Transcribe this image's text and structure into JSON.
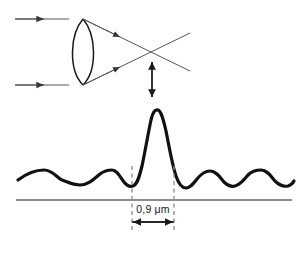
{
  "figure": {
    "background_color": "#ffffff",
    "width": 306,
    "height": 253
  },
  "optics": {
    "lens": {
      "name": "biconvex-lens",
      "color": "#1a1a1a",
      "top_vertex_y": 19,
      "bottom_vertex_y": 85,
      "left_x": 68,
      "right_x": 98
    },
    "incoming_rays": [
      {
        "label": "upper-incoming-ray",
        "y": 19,
        "x_start": 15,
        "x_end": 68,
        "arrow_x": 42
      },
      {
        "label": "lower-incoming-ray",
        "y": 85,
        "x_start": 15,
        "x_end": 68,
        "arrow_x": 42
      }
    ],
    "converging_rays": [
      {
        "label": "upper-converging-ray",
        "from": "lens-top",
        "arrow_x": 118
      },
      {
        "label": "lower-converging-ray",
        "from": "lens-bottom",
        "arrow_x": 118
      }
    ],
    "focal_point": {
      "x": 152,
      "y": 52
    },
    "ray_color": "#555555"
  },
  "indicator": {
    "name": "focal-depth-double-arrow",
    "x": 152,
    "y_top": 60,
    "y_bottom": 98,
    "color": "#1a1a1a"
  },
  "dimension": {
    "label": "0,9 μm",
    "value": 0.9,
    "unit": "μm",
    "left_x": 132,
    "right_x": 174,
    "line_y": 222,
    "label_y": 213,
    "color": "#1a1a1a"
  },
  "guides": {
    "dashed_color": "#8c8c8c",
    "baseline_color": "#8c8c8c",
    "baseline_y": 200,
    "dashed_lines": [
      {
        "name": "left-dashed-guide",
        "x": 132,
        "y_top": 166,
        "y_bottom": 231
      },
      {
        "name": "right-dashed-guide",
        "x": 174,
        "y_top": 166,
        "y_bottom": 231
      }
    ]
  },
  "chart_data": {
    "type": "line",
    "xlabel": "",
    "ylabel": "",
    "curve_color": "#111111",
    "curve_width": 3.2,
    "peak": {
      "x": 153,
      "y": 110
    },
    "baseline_level_y": 178,
    "first_minimum_left_x": 132,
    "first_minimum_right_x": 174,
    "central_peak_width_um": 0.9,
    "x_range": [
      18,
      292
    ],
    "side_lobes_left": [
      {
        "x": 62,
        "y": 171
      },
      {
        "x": 105,
        "y": 170
      }
    ],
    "side_lobes_right": [
      {
        "x": 205,
        "y": 170
      },
      {
        "x": 250,
        "y": 170
      }
    ],
    "path": "M18,180 C26,174 34,170 44,170 C53,170 57,178 62,180 C68,182 72,185 80,185 C88,185 94,179 100,174 C104,171 107,170 112,170 C117,170 120,177 124,182 C127,186 130,187 133,186 C137,185 139,178 142,166 C145,152 148,134 151,120 C153,112 155,109 158,110 C161,111 163,118 166,131 C169,146 172,164 176,176 C179,185 182,188 186,188 C190,188 193,184 197,179 C201,174 205,171 210,171 C216,171 220,177 224,182 C228,186 231,187 235,186 C240,185 244,180 248,175 C252,171 256,170 261,170 C267,170 271,176 275,181 C279,185 283,187 288,186 C291,185 293,183 294,181"
  }
}
